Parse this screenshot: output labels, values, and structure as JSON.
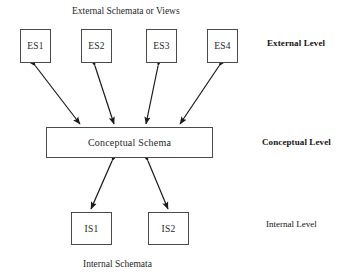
{
  "diagram": {
    "title_caption": "External Schemata or Views",
    "bottom_caption": "Internal Schemata",
    "external_boxes": [
      {
        "label": "ES1"
      },
      {
        "label": "ES2"
      },
      {
        "label": "ES3"
      },
      {
        "label": "ES4"
      }
    ],
    "conceptual_box": {
      "label": "Conceptual Schema"
    },
    "internal_boxes": [
      {
        "label": "IS1"
      },
      {
        "label": "IS2"
      }
    ],
    "level_labels": {
      "external": "External Level",
      "conceptual": "Conceptual Level",
      "internal": "Internal Level"
    },
    "colors": {
      "background": "#ffffff",
      "box_border": "#4a4a4a",
      "line": "#1a1a1a",
      "text": "#1f1f1f"
    }
  }
}
